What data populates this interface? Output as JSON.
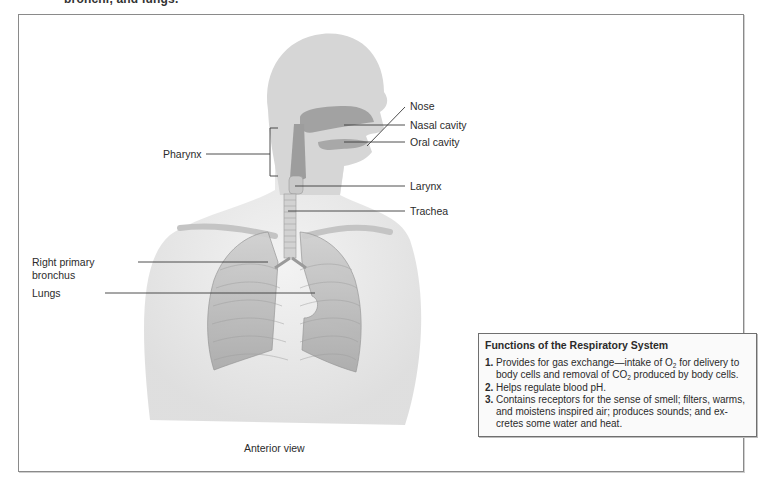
{
  "figure": {
    "top_caption_fragment": "bronchi, and lungs.",
    "view_label": "Anterior view",
    "labels": {
      "nose": "Nose",
      "nasal_cavity": "Nasal cavity",
      "oral_cavity": "Oral cavity",
      "pharynx": "Pharynx",
      "larynx": "Larynx",
      "trachea": "Trachea",
      "right_primary_bronchus_line1": "Right primary",
      "right_primary_bronchus_line2": "bronchus",
      "lungs": "Lungs"
    }
  },
  "info_box": {
    "title": "Functions of the Respiratory System",
    "items": [
      {
        "num": "1.",
        "parts": [
          "Provides for gas exchange—intake of O",
          "2",
          " for delivery to body cells and removal of CO",
          "2",
          " produced by body cells."
        ]
      },
      {
        "num": "2.",
        "text": "Helps regulate blood pH."
      },
      {
        "num": "3.",
        "text": "Contains receptors for the sense of smell; filters, warms, and moistens inspired air; produces sounds; and ex-cretes some water and heat."
      }
    ]
  },
  "colors": {
    "body_fill": "#e6e6e6",
    "airway_fill": "#9a9a9a",
    "lung_fill": "#b8b8b8",
    "leader_line": "#3a3a3a",
    "frame_border": "#8a8a8a"
  }
}
